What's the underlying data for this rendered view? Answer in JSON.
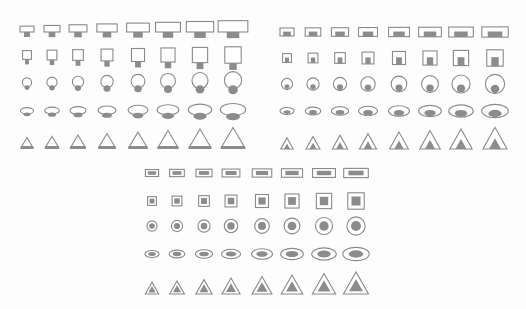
{
  "diagram": {
    "colors": {
      "background": "#fdfdfd",
      "stroke": "#8a8a8a",
      "fill": "#8c8c8c",
      "white": "#ffffff"
    },
    "shape_rows": [
      "wide-rectangle",
      "square",
      "circle",
      "ellipse",
      "triangle"
    ],
    "panels": [
      {
        "name": "panel-a-attached",
        "style": "attached",
        "columns_x": [
          27,
          52,
          78,
          107,
          138,
          168,
          200,
          233
        ],
        "rows_y": [
          32,
          58,
          85,
          112,
          143
        ]
      },
      {
        "name": "panel-b-bottom-aligned",
        "style": "bottom",
        "columns_x": [
          287,
          313,
          340,
          368,
          399,
          430,
          461,
          495
        ],
        "rows_y": [
          32,
          58,
          84,
          111,
          143
        ]
      },
      {
        "name": "panel-c-centered",
        "style": "center",
        "columns_x": [
          152,
          177,
          204,
          231,
          262,
          292,
          324,
          356
        ],
        "rows_y": [
          173,
          201,
          226,
          254,
          288
        ]
      }
    ],
    "scale_steps": [
      1,
      1.14,
      1.28,
      1.45,
      1.62,
      1.78,
      1.95,
      2.12
    ]
  }
}
